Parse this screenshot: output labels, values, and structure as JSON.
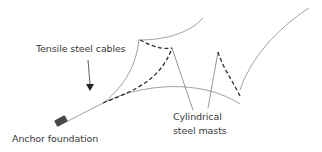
{
  "diagram": {
    "labels": {
      "cables": "Tensile steel cables",
      "anchor": "Anchor foundation",
      "masts_line1": "Cylindrical",
      "masts_line2": "steel masts"
    },
    "colors": {
      "cable_line": "#8a8a8a",
      "mast_line": "#6a6a6a",
      "dashed_stay": "#2e2e2e",
      "anchor_block": "#4a4a4a",
      "text": "#3a3a3a",
      "background": "#ffffff"
    }
  }
}
